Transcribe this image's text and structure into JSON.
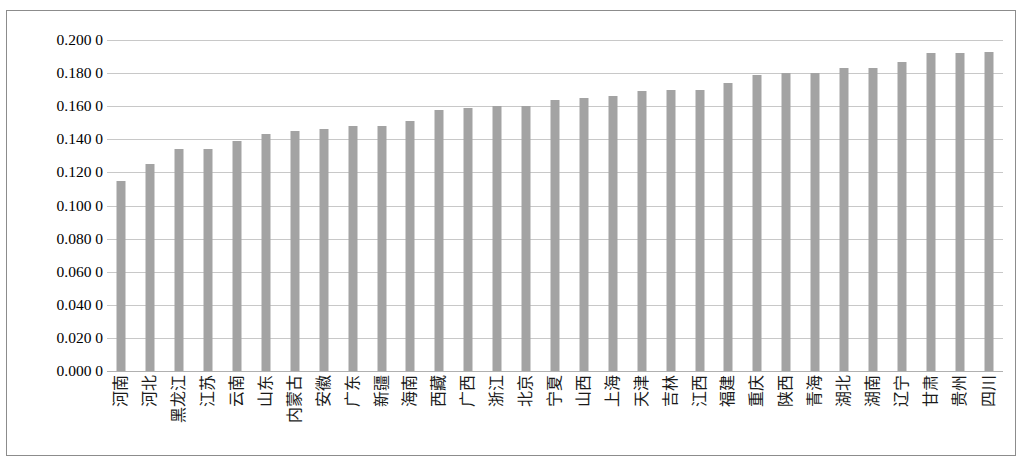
{
  "chart_data": {
    "type": "bar",
    "title": "",
    "subtitle": "",
    "xlabel": "",
    "ylabel": "",
    "ylim": [
      0.0,
      0.2
    ],
    "grid": true,
    "legend": null,
    "bar_color": "#a3a3a3",
    "y_ticks": [
      "0.200 0",
      "0.180 0",
      "0.160 0",
      "0.140 0",
      "0.120 0",
      "0.100 0",
      "0.080 0",
      "0.060 0",
      "0.040 0",
      "0.020 0",
      "0.000 0"
    ],
    "y_tick_values": [
      0.2,
      0.18,
      0.16,
      0.14,
      0.12,
      0.1,
      0.08,
      0.06,
      0.04,
      0.02,
      0.0
    ],
    "categories": [
      "河南",
      "河北",
      "黑龙江",
      "江苏",
      "云南",
      "山东",
      "内蒙古",
      "安徽",
      "广东",
      "新疆",
      "海南",
      "西藏",
      "广西",
      "浙江",
      "北京",
      "宁夏",
      "山西",
      "上海",
      "天津",
      "吉林",
      "江西",
      "福建",
      "重庆",
      "陕西",
      "青海",
      "湖北",
      "湖南",
      "辽宁",
      "甘肃",
      "贵州",
      "四川"
    ],
    "values": [
      0.115,
      0.125,
      0.134,
      0.134,
      0.139,
      0.143,
      0.145,
      0.146,
      0.148,
      0.148,
      0.151,
      0.158,
      0.159,
      0.16,
      0.16,
      0.164,
      0.165,
      0.166,
      0.169,
      0.17,
      0.17,
      0.174,
      0.179,
      0.18,
      0.18,
      0.183,
      0.183,
      0.187,
      0.192,
      0.192,
      0.193
    ]
  }
}
